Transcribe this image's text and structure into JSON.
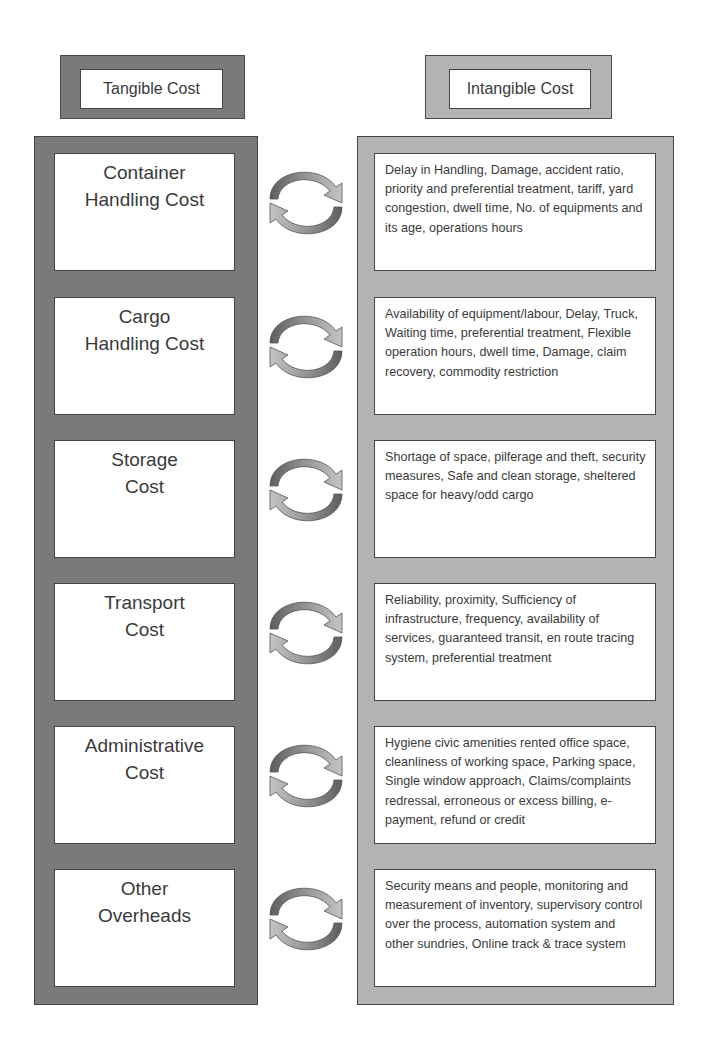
{
  "headers": {
    "tangible": "Tangible Cost",
    "intangible": "Intangible Cost"
  },
  "colors": {
    "tangible_panel": "#7a7a7a",
    "intangible_panel": "#b3b3b3",
    "box_fill": "#ffffff",
    "border": "#444444",
    "arrow_dark": "#6b6b6b",
    "arrow_light": "#b8b8b8"
  },
  "rows": [
    {
      "tangible": "Container\nHandling Cost",
      "intangible": "Delay in Handling, Damage, accident ratio, priority and preferential treatment, tariff, yard congestion, dwell time, No. of equipments and its age, operations hours",
      "relation_icon": "cycle-arrows-icon"
    },
    {
      "tangible": "Cargo\nHandling Cost",
      "intangible": "Availability of equipment/labour, Delay, Truck, Waiting time, preferential treatment, Flexible operation hours, dwell time, Damage, claim recovery, commodity restriction",
      "relation_icon": "cycle-arrows-icon"
    },
    {
      "tangible": "Storage\nCost",
      "intangible": "Shortage of space, pilferage and theft, security measures, Safe and clean storage, sheltered space for heavy/odd cargo",
      "relation_icon": "cycle-arrows-icon"
    },
    {
      "tangible": "Transport\nCost",
      "intangible": "Reliability, proximity, Sufficiency of infrastructure, frequency, availability of services, guaranteed transit, en route tracing system, preferential treatment",
      "relation_icon": "cycle-arrows-icon"
    },
    {
      "tangible": "Administrative\nCost",
      "intangible": "Hygiene civic amenities rented office space, cleanliness of working space, Parking space, Single window approach, Claims/complaints redressal, erroneous or excess billing, e-payment, refund or credit",
      "relation_icon": "cycle-arrows-icon"
    },
    {
      "tangible": "Other\nOverheads",
      "intangible": "Security means and people, monitoring and measurement of inventory, supervisory control over the process, automation system and other sundries, Online track & trace system",
      "relation_icon": "cycle-arrows-icon"
    }
  ]
}
